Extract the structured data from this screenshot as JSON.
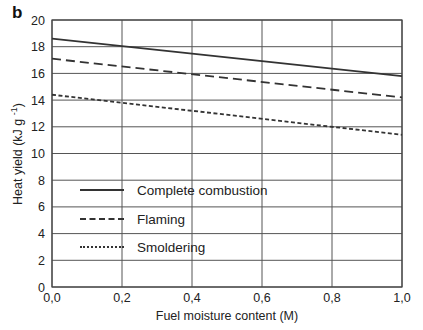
{
  "figure": {
    "panel_label": "b"
  },
  "chart_data": {
    "type": "line",
    "title": "",
    "xlabel": "Fuel moisture content (M)",
    "ylabel": "Heat yield (kJ g⁻¹)",
    "xlim": [
      0.0,
      1.0
    ],
    "ylim": [
      0,
      20
    ],
    "x_ticks": [
      "0,0",
      "0,2",
      "0,4",
      "0,6",
      "0,8",
      "1,0"
    ],
    "y_ticks": [
      "0",
      "2",
      "4",
      "6",
      "8",
      "10",
      "12",
      "14",
      "16",
      "18",
      "20"
    ],
    "grid": true,
    "legend_position": "inside lower-left",
    "x": [
      0.0,
      1.0
    ],
    "series": [
      {
        "name": "Complete combustion",
        "style": "solid",
        "values": [
          18.6,
          15.8
        ]
      },
      {
        "name": "Flaming",
        "style": "dashed",
        "values": [
          17.1,
          14.2
        ]
      },
      {
        "name": "Smoldering",
        "style": "dotted",
        "values": [
          14.4,
          11.4
        ]
      }
    ]
  },
  "colors": {
    "line": "#333333",
    "grid": "#555555",
    "text": "#222222"
  }
}
